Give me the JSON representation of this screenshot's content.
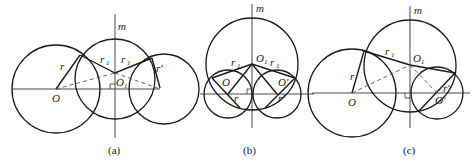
{
  "panels": [
    {
      "id": "a",
      "caption": "(a)",
      "labels": {
        "axis": "m",
        "O": "O",
        "O1": "O",
        "O1_sub": "1",
        "Op": "O'",
        "r": "r",
        "r1a": "r",
        "r1a_sub": "1",
        "r1b": "r",
        "r1b_sub": "1",
        "rp": "r'"
      }
    },
    {
      "id": "b",
      "caption": "(b)",
      "labels": {
        "axis": "m",
        "O": "O",
        "O1": "O",
        "O1_sub": "1",
        "Op": "O'",
        "r": "r",
        "r1a": "r",
        "r1a_sub": "1",
        "r1b": "r",
        "r1b_sub": "1",
        "rp": "r'"
      }
    },
    {
      "id": "c",
      "caption": "(c)",
      "labels": {
        "axis": "m",
        "O": "O",
        "O1": "O",
        "O1_sub": "1",
        "Op": "O'",
        "r": "r",
        "r1a": "r",
        "r1a_sub": "1",
        "rp": "r'"
      }
    }
  ]
}
